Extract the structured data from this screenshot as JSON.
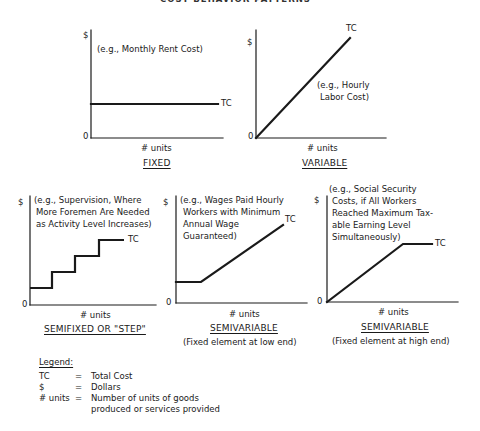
{
  "header": {
    "title": "COST BEHAVIOR PATTERNS"
  },
  "axis": {
    "y_label": "$",
    "x_label": "# units",
    "origin": "0",
    "curve_label": "TC"
  },
  "charts": [
    {
      "id": "fixed",
      "title": "FIXED",
      "subtitle": "",
      "example": [
        "(e.g., Monthly Rent Cost)"
      ]
    },
    {
      "id": "variable",
      "title": "VARIABLE",
      "subtitle": "",
      "example": [
        "(e.g., Hourly",
        "Labor Cost)"
      ]
    },
    {
      "id": "semifixed",
      "title": "SEMIFIXED OR \"STEP\"",
      "subtitle": "",
      "example": [
        "(e.g., Supervision, Where",
        "More Foremen Are Needed",
        "as Activity Level Increases)"
      ]
    },
    {
      "id": "semivariable-low",
      "title": "SEMIVARIABLE",
      "subtitle": "(Fixed element at low end)",
      "example": [
        "(e.g., Wages Paid Hourly",
        "Workers with Minimum",
        "Annual Wage",
        "Guaranteed)"
      ]
    },
    {
      "id": "semivariable-high",
      "title": "SEMIVARIABLE",
      "subtitle": "(Fixed element at high end)",
      "example": [
        "(e.g., Social Security",
        "Costs, if All Workers",
        "Reached Maximum Tax-",
        "able Earning Level",
        "Simultaneously)"
      ]
    }
  ],
  "legend": {
    "title": "Legend:",
    "items": [
      {
        "symbol": "TC",
        "eq": "=",
        "meaning": "Total Cost"
      },
      {
        "symbol": "$",
        "eq": "=",
        "meaning": "Dollars"
      },
      {
        "symbol": "# units",
        "eq": "=",
        "meaning": "Number of units of goods",
        "meaning2": "produced or services provided"
      }
    ]
  },
  "colors": {
    "ink": "#1a1a1a",
    "background": "#ffffff"
  }
}
